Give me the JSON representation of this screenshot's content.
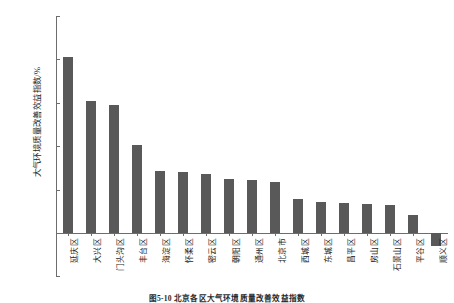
{
  "chart_data": {
    "type": "bar",
    "title": "",
    "xlabel": "",
    "ylabel": "大气环境质量改善效益指数/%",
    "ylim": [
      -0.5,
      2.5
    ],
    "yticks": [
      "2.5",
      "2.0",
      "1.5",
      "1.0",
      "0.5",
      "0.0",
      "-0.5"
    ],
    "ytick_values": [
      2.5,
      2.0,
      1.5,
      1.0,
      0.5,
      0.0,
      -0.5
    ],
    "grid": false,
    "legend": "none",
    "bar_color": "#595959",
    "categories": [
      "延庆区",
      "大兴区",
      "门头沟区",
      "丰台区",
      "海淀区",
      "怀柔区",
      "密云区",
      "朝阳区",
      "通州区",
      "北京市",
      "西城区",
      "东城区",
      "昌平区",
      "房山区",
      "石景山区",
      "平谷区",
      "顺义区"
    ],
    "values": [
      2.03,
      1.52,
      1.48,
      1.01,
      0.72,
      0.7,
      0.68,
      0.62,
      0.61,
      0.59,
      0.39,
      0.36,
      0.34,
      0.33,
      0.32,
      0.21,
      -0.15
    ]
  },
  "caption": {
    "text": "图5-10  北京各区大气环境质量改善效益指数"
  }
}
